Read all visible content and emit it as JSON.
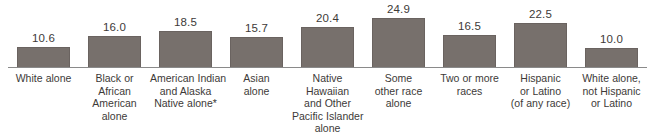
{
  "chart_data": {
    "type": "bar",
    "title": "",
    "subtitle": "",
    "xlabel": "",
    "ylabel": "",
    "ylim": [
      0,
      26
    ],
    "grid": false,
    "legend": "none",
    "orientation": "vertical",
    "bar_color": "#77706c",
    "axis_color": "#8a8a8a",
    "text_color": "#3d3a38",
    "background": "#ffffff",
    "value_label_format": "one-decimal",
    "categories": [
      "White alone",
      "Black or African American alone",
      "American Indian and Alaska Native alone*",
      "Asian alone",
      "Native Hawaiian and Other Pacific Islander alone",
      "Some other race alone",
      "Two or more races",
      "Hispanic or Latino (of any race)",
      "White alone, not Hispanic or Latino"
    ],
    "values": [
      10.6,
      16.0,
      18.5,
      15.7,
      20.4,
      24.9,
      16.5,
      22.5,
      10.0
    ],
    "value_labels": [
      "10.6",
      "16.0",
      "18.5",
      "15.7",
      "20.4",
      "24.9",
      "16.5",
      "22.5",
      "10.0"
    ],
    "category_label_lines": [
      [
        "White alone"
      ],
      [
        "Black or",
        "African",
        "American",
        "alone"
      ],
      [
        "American Indian",
        "and Alaska",
        "Native alone*"
      ],
      [
        "Asian",
        "alone"
      ],
      [
        "Native",
        "Hawaiian",
        "and Other",
        "Pacific Islander",
        "alone"
      ],
      [
        "Some",
        "other race",
        "alone"
      ],
      [
        "Two or more",
        "races"
      ],
      [
        "Hispanic",
        "or Latino",
        "(of any race)"
      ],
      [
        "White alone,",
        "not Hispanic",
        "or Latino"
      ]
    ]
  }
}
